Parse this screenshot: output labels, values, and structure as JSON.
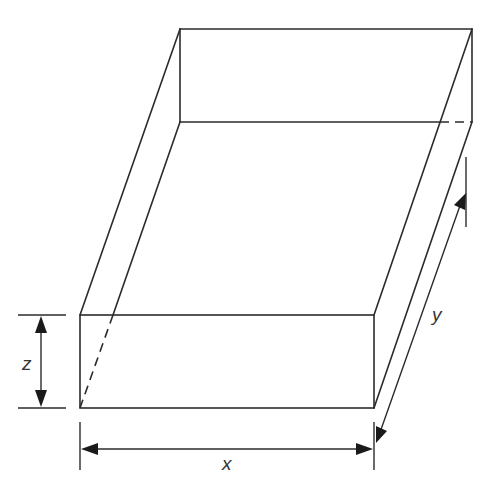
{
  "diagram": {
    "colors": {
      "line": "#2b2b2b",
      "arrow": "#1a1a1a",
      "label": "#333333",
      "background": "#ffffff"
    },
    "labels": {
      "x": "x",
      "y": "y",
      "z": "z"
    },
    "dimensions": [
      {
        "name": "x",
        "meaning": "length along front bottom edge"
      },
      {
        "name": "y",
        "meaning": "depth along receding side edge"
      },
      {
        "name": "z",
        "meaning": "height of front face"
      }
    ]
  }
}
